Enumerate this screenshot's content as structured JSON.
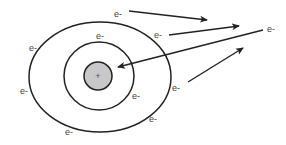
{
  "diagram": {
    "type": "atom-electron-shells",
    "colors": {
      "background": "#ffffff",
      "stroke": "#222222",
      "nucleus_fill": "#c8c8c8",
      "label": "#444444"
    },
    "nucleus": {
      "label": "+",
      "cx": 98,
      "cy": 76,
      "r": 14
    },
    "shells": [
      {
        "name": "inner-shell",
        "cx": 99,
        "cy": 76,
        "rx": 35,
        "ry": 34
      },
      {
        "name": "outer-shell",
        "cx": 100,
        "cy": 77,
        "rx": 71,
        "ry": 55
      }
    ],
    "electrons": [
      {
        "label": "e-",
        "x": 118,
        "y": 17
      },
      {
        "label": "e-",
        "x": 158,
        "y": 38
      },
      {
        "label": "e-",
        "x": 33,
        "y": 51
      },
      {
        "label": "e-",
        "x": 100,
        "y": 39
      },
      {
        "label": "e-",
        "x": 24,
        "y": 94
      },
      {
        "label": "e-",
        "x": 136,
        "y": 99
      },
      {
        "label": "e-",
        "x": 176,
        "y": 91
      },
      {
        "label": "e-",
        "x": 153,
        "y": 122
      },
      {
        "label": "e-",
        "x": 69,
        "y": 135
      },
      {
        "label": "e-",
        "x": 271,
        "y": 32
      }
    ],
    "arrows": [
      {
        "name": "arrow-electron-escaping-1",
        "x1": 129,
        "y1": 11,
        "x2": 207,
        "y2": 20
      },
      {
        "name": "arrow-electron-escaping-2",
        "x1": 169,
        "y1": 35,
        "x2": 239,
        "y2": 26
      },
      {
        "name": "arrow-electron-attracted-to-nucleus",
        "x1": 263,
        "y1": 30,
        "x2": 118,
        "y2": 67
      },
      {
        "name": "arrow-incoming",
        "x1": 188,
        "y1": 82,
        "x2": 243,
        "y2": 48
      }
    ]
  }
}
